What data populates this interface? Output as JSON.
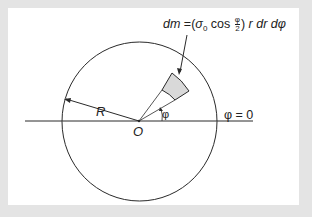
{
  "diagram": {
    "formula": {
      "lhs": "dm",
      "equals": "=",
      "open": "(",
      "sigma": "σ",
      "sigma_sub": "0",
      "cos": "cos",
      "frac_num": "φ",
      "frac_den": "2",
      "close": ")",
      "rest": "r dr dφ"
    },
    "labels": {
      "radius": "R",
      "origin": "O",
      "angle": "φ",
      "reference": "φ = 0"
    },
    "colors": {
      "frame": "#e4e4e4",
      "panel": "#ffffff",
      "stroke": "#2a2a2a",
      "element_fill": "#d9d9d9"
    }
  }
}
